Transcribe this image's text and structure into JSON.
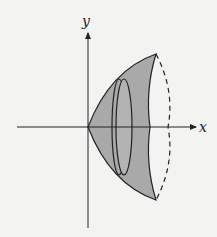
{
  "figure": {
    "axes": {
      "x_label": "x",
      "y_label": "y"
    },
    "colors": {
      "fill": "#a9a9a9",
      "stroke": "#222222",
      "background": "#f3f3f1"
    }
  }
}
